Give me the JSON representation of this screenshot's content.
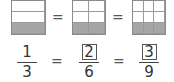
{
  "diagram": {
    "bars": [
      {
        "cols": 1,
        "rows": 3,
        "shaded_row": 3
      },
      {
        "cols": 2,
        "rows": 3,
        "shaded_row": 3
      },
      {
        "cols": 3,
        "rows": 3,
        "shaded_row": 3
      }
    ],
    "equals": "=",
    "fractions": [
      {
        "numerator": "1",
        "denominator": "3",
        "boxed": false
      },
      {
        "numerator": "2",
        "denominator": "6",
        "boxed": true
      },
      {
        "numerator": "3",
        "denominator": "9",
        "boxed": true
      }
    ],
    "colors": {
      "shaded": "#a6a6a6",
      "border": "#8a8a8a"
    }
  }
}
